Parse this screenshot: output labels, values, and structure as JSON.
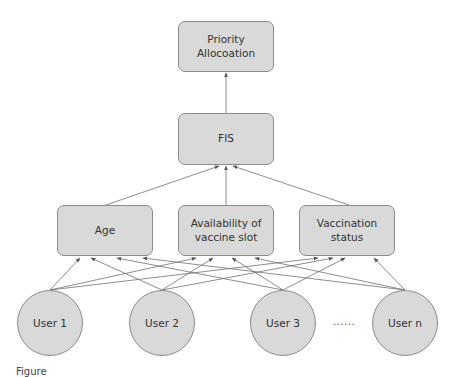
{
  "diagram": {
    "top": {
      "label": "Priority Allocoation"
    },
    "middle": {
      "label": "FIS"
    },
    "criteria": [
      {
        "label": "Age"
      },
      {
        "label": "Availability of vaccine slot"
      },
      {
        "label": "Vaccination status"
      }
    ],
    "users": [
      {
        "label": "User 1"
      },
      {
        "label": "User 2"
      },
      {
        "label": "User 3"
      },
      {
        "label": "User n"
      }
    ],
    "ellipsis": "......",
    "edges": [
      {
        "from": "FIS",
        "to": "Priority Allocoation"
      },
      {
        "from": "Age",
        "to": "FIS"
      },
      {
        "from": "Availability of vaccine slot",
        "to": "FIS"
      },
      {
        "from": "Vaccination status",
        "to": "FIS"
      },
      {
        "from": "User 1",
        "to": "Age"
      },
      {
        "from": "User 1",
        "to": "Availability of vaccine slot"
      },
      {
        "from": "User 1",
        "to": "Vaccination status"
      },
      {
        "from": "User 2",
        "to": "Age"
      },
      {
        "from": "User 2",
        "to": "Availability of vaccine slot"
      },
      {
        "from": "User 2",
        "to": "Vaccination status"
      },
      {
        "from": "User 3",
        "to": "Age"
      },
      {
        "from": "User 3",
        "to": "Availability of vaccine slot"
      },
      {
        "from": "User 3",
        "to": "Vaccination status"
      },
      {
        "from": "User n",
        "to": "Age"
      },
      {
        "from": "User n",
        "to": "Availability of vaccine slot"
      },
      {
        "from": "User n",
        "to": "Vaccination status"
      }
    ]
  },
  "caption": {
    "text": "Figure"
  },
  "colors": {
    "node_fill": "#d9d9d9",
    "node_border": "#8c8c8c",
    "edge": "#707070",
    "text": "#333333"
  }
}
